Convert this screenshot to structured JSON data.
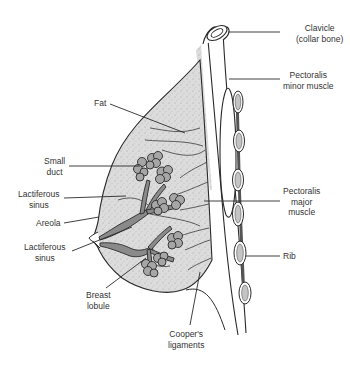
{
  "diagram": {
    "colors": {
      "outline": "#2a2a2a",
      "tissue_fill": "#d9d9d9",
      "duct_fill": "#8a8a8a",
      "lobule_fill": "#a6a6a6",
      "rib_fill": "#bfbfbf",
      "label_text": "#333333",
      "background": "#ffffff"
    },
    "labels": {
      "clavicle": [
        "Clavicle",
        "(collar bone)"
      ],
      "pectoralis_minor": [
        "Pectoralis",
        "minor muscle"
      ],
      "fat": [
        "Fat"
      ],
      "small_duct": [
        "Small",
        "duct"
      ],
      "lactiferous_sinus_upper": [
        "Lactiferous",
        "sinus"
      ],
      "areola": [
        "Areola"
      ],
      "lactiferous_sinus_lower": [
        "Lactiferous",
        "sinus"
      ],
      "breast_lobule": [
        "Breast",
        "lobule"
      ],
      "pectoralis_major": [
        "Pectoralis",
        "major",
        "muscle"
      ],
      "rib": [
        "Rib"
      ],
      "coopers_ligaments": [
        "Cooper's",
        "ligaments"
      ]
    }
  }
}
